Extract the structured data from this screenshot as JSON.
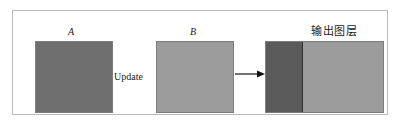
{
  "figure": {
    "caption_visible": false,
    "frame": {
      "border_color": "#b9b9b9"
    },
    "blocks": [
      {
        "id": "a",
        "label": "A",
        "fill": "#6e6e6e",
        "border": "#7d7d7d",
        "role": "source-layer-a"
      },
      {
        "id": "b",
        "label": "B",
        "fill": "#9c9c9c",
        "border": "#7d7d7d",
        "role": "source-layer-b"
      },
      {
        "id": "output",
        "label": "输出图层",
        "fill_left": "#5a5a5a",
        "fill_right": "#9c9c9c",
        "divider": "#2f2f2f",
        "border": "#7d7d7d",
        "role": "output-layer"
      }
    ],
    "operation_label": "Update",
    "arrow": {
      "direction": "right",
      "color": "#111111",
      "from": "b",
      "to": "output"
    }
  }
}
